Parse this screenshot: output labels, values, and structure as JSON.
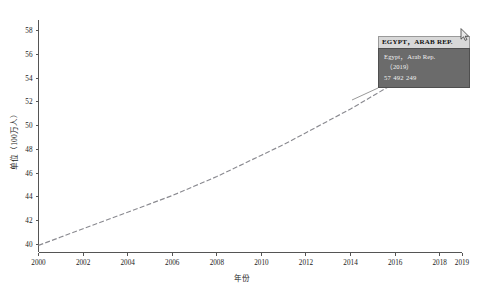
{
  "chart_data": {
    "type": "line",
    "title": "",
    "xlabel": "年份",
    "ylabel": "单位（100万人）",
    "xlim": [
      2000,
      2019
    ],
    "ylim": [
      39.3,
      58.9
    ],
    "grid": false,
    "legend": "none",
    "x_ticks": [
      "2000",
      "2002",
      "2004",
      "2006",
      "2008",
      "2010",
      "2012",
      "2014",
      "2016",
      "2018",
      "2019"
    ],
    "x_tick_values": [
      2000,
      2002,
      2004,
      2006,
      2008,
      2010,
      2012,
      2014,
      2016,
      2018,
      2019
    ],
    "y_ticks": [
      "40",
      "42",
      "44",
      "46",
      "48",
      "50",
      "52",
      "54",
      "56",
      "58"
    ],
    "y_tick_values": [
      40,
      42,
      44,
      46,
      48,
      50,
      52,
      54,
      56,
      58
    ],
    "series": [
      {
        "name": "Egypt, Arab Rep.",
        "x": [
          2000,
          2001,
          2002,
          2003,
          2004,
          2005,
          2006,
          2007,
          2008,
          2009,
          2010,
          2011,
          2012,
          2013,
          2014,
          2015,
          2016,
          2017,
          2018,
          2019
        ],
        "values": [
          39.9,
          40.6,
          41.3,
          42.0,
          42.7,
          43.4,
          44.1,
          44.9,
          45.7,
          46.6,
          47.5,
          48.4,
          49.4,
          50.4,
          51.4,
          52.5,
          53.6,
          54.8,
          56.1,
          57.5
        ]
      }
    ],
    "annotations": [
      {
        "label": "EGYPT, ARAB REP.",
        "name": "Egypt，Arab Rep.",
        "year": "（2019）",
        "value": "57 492 249"
      }
    ]
  },
  "tooltip": {
    "header": "EGYPT，ARAB REP.",
    "country": "Egypt，Arab Rep.",
    "year": "（2019）",
    "value": "57 492 249"
  },
  "axes": {
    "x_title": "年份",
    "y_title": "单位（100万人）"
  }
}
